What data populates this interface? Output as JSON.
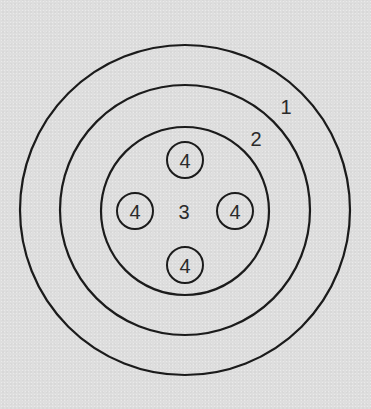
{
  "diagram": {
    "type": "concentric-circles",
    "colors": {
      "background": "#dedede",
      "stroke": "#1b1b1b",
      "text": "#2a2a2a"
    },
    "rings": [
      {
        "id": "ring-1",
        "label": "1",
        "cx": 185,
        "cy": 210,
        "r": 165,
        "label_pos": [
          286,
          107
        ]
      },
      {
        "id": "ring-2",
        "label": "2",
        "cx": 185,
        "cy": 210,
        "r": 125,
        "label_pos": [
          256,
          139
        ]
      },
      {
        "id": "ring-3",
        "label": "3",
        "cx": 185,
        "cy": 211,
        "r": 84,
        "label_pos": [
          184,
          212
        ]
      }
    ],
    "inner_circles": [
      {
        "id": "top",
        "label": "4",
        "cx": 185,
        "cy": 160,
        "r": 18
      },
      {
        "id": "left",
        "label": "4",
        "cx": 135,
        "cy": 211,
        "r": 18
      },
      {
        "id": "right",
        "label": "4",
        "cx": 235,
        "cy": 211,
        "r": 18
      },
      {
        "id": "bottom",
        "label": "4",
        "cx": 185,
        "cy": 265,
        "r": 18
      }
    ]
  }
}
